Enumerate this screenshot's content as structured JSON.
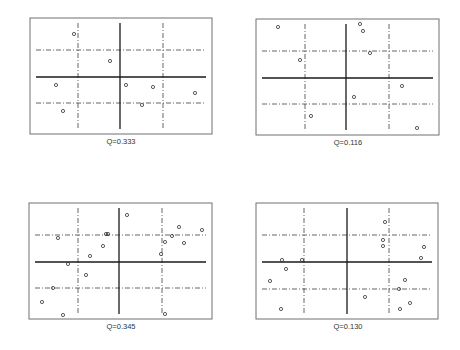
{
  "chart_data": [
    {
      "type": "scatter",
      "title": "",
      "label": "Q=0.333",
      "frame": {
        "x0": 30,
        "y0": 18,
        "x1": 212,
        "y1": 134
      },
      "axes": {
        "solid_x": 120,
        "solid_y": 77,
        "dash_x": [
          78,
          163
        ],
        "dash_y": [
          50,
          103
        ]
      },
      "grid": false,
      "points": [
        [
          74,
          34
        ],
        [
          110,
          61
        ],
        [
          56,
          85
        ],
        [
          63,
          111
        ],
        [
          126,
          85
        ],
        [
          153,
          87
        ],
        [
          142,
          105
        ],
        [
          195,
          93
        ]
      ]
    },
    {
      "type": "scatter",
      "title": "",
      "label": "Q=0.116",
      "frame": {
        "x0": 256,
        "y0": 19,
        "x1": 439,
        "y1": 135
      },
      "axes": {
        "solid_x": 346,
        "solid_y": 78,
        "dash_x": [
          305,
          389
        ],
        "dash_y": [
          51,
          104
        ]
      },
      "grid": false,
      "points": [
        [
          278,
          27
        ],
        [
          300,
          60
        ],
        [
          311,
          116
        ],
        [
          360,
          24
        ],
        [
          363,
          31
        ],
        [
          370,
          53
        ],
        [
          402,
          86
        ],
        [
          354,
          97
        ],
        [
          417,
          128
        ]
      ]
    },
    {
      "type": "scatter",
      "title": "",
      "label": "Q=0.345",
      "frame": {
        "x0": 29,
        "y0": 203,
        "x1": 212,
        "y1": 319
      },
      "axes": {
        "solid_x": 119,
        "solid_y": 262,
        "dash_x": [
          78,
          162
        ],
        "dash_y": [
          235,
          288
        ]
      },
      "grid": false,
      "points": [
        [
          58,
          238
        ],
        [
          106,
          234
        ],
        [
          108,
          234
        ],
        [
          103,
          246
        ],
        [
          90,
          256
        ],
        [
          68,
          264
        ],
        [
          86,
          275
        ],
        [
          53,
          288
        ],
        [
          42,
          302
        ],
        [
          63,
          315
        ],
        [
          127,
          215
        ],
        [
          179,
          227
        ],
        [
          202,
          230
        ],
        [
          172,
          236
        ],
        [
          165,
          242
        ],
        [
          184,
          243
        ],
        [
          161,
          254
        ],
        [
          165,
          314
        ]
      ]
    },
    {
      "type": "scatter",
      "title": "",
      "label": "Q=0.130",
      "frame": {
        "x0": 256,
        "y0": 203,
        "x1": 438,
        "y1": 319
      },
      "axes": {
        "solid_x": 347,
        "solid_y": 262,
        "dash_x": [
          304,
          389
        ],
        "dash_y": [
          235,
          289
        ]
      },
      "grid": false,
      "points": [
        [
          282,
          260
        ],
        [
          302,
          260
        ],
        [
          286,
          269
        ],
        [
          270,
          281
        ],
        [
          281,
          309
        ],
        [
          385,
          222
        ],
        [
          383,
          240
        ],
        [
          383,
          246
        ],
        [
          424,
          247
        ],
        [
          421,
          258
        ],
        [
          405,
          280
        ],
        [
          399,
          289
        ],
        [
          365,
          297
        ],
        [
          410,
          303
        ],
        [
          400,
          309
        ]
      ]
    }
  ],
  "panels": {
    "p1": {
      "label": "Q=0.333"
    },
    "p2": {
      "label": "Q=0.116"
    },
    "p3": {
      "label": "Q=0.345"
    },
    "p4": {
      "label": "Q=0.130"
    }
  },
  "colors": {
    "frame": "#707070",
    "axis": "#1a1a1a",
    "point": "#333333"
  }
}
